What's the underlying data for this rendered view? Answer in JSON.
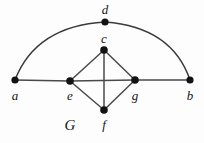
{
  "figure": {
    "name": "G",
    "name_label_position": {
      "x": 70,
      "y": 125
    },
    "background_color": "#fdfdfd",
    "edge_color": "#4a4a4a",
    "arc_color": "#3b3b3b",
    "vertex_color": "#121212",
    "label_color": "#161616",
    "width": 204,
    "height": 143
  },
  "graph_data": {
    "type": "undirected-graph",
    "vertex_count": 7,
    "edge_count": 8,
    "vertices": [
      {
        "id": "a",
        "label": "a",
        "x": 15,
        "y": 80,
        "r": 3.6,
        "label_x": 15,
        "label_y": 95
      },
      {
        "id": "b",
        "label": "b",
        "x": 190,
        "y": 80,
        "r": 3.6,
        "label_x": 190,
        "label_y": 95
      },
      {
        "id": "c",
        "label": "c",
        "x": 104,
        "y": 50,
        "r": 3.8,
        "label_x": 104,
        "label_y": 38
      },
      {
        "id": "d",
        "label": "d",
        "x": 105,
        "y": 22,
        "r": 3.6,
        "label_x": 105,
        "label_y": 9
      },
      {
        "id": "e",
        "label": "e",
        "x": 70,
        "y": 81,
        "r": 3.8,
        "label_x": 70,
        "label_y": 95
      },
      {
        "id": "f",
        "label": "f",
        "x": 104,
        "y": 110,
        "r": 3.8,
        "label_x": 104,
        "label_y": 124
      },
      {
        "id": "g",
        "label": "g",
        "x": 135,
        "y": 80,
        "r": 3.8,
        "label_x": 135,
        "label_y": 95
      }
    ],
    "straight_edges": [
      {
        "id": "a-e",
        "from": "a",
        "to": "e",
        "x1": 15,
        "y1": 80,
        "x2": 70,
        "y2": 81
      },
      {
        "id": "e-g",
        "from": "e",
        "to": "g",
        "x1": 70,
        "y1": 81,
        "x2": 135,
        "y2": 80
      },
      {
        "id": "g-b",
        "from": "g",
        "to": "b",
        "x1": 135,
        "y1": 80,
        "x2": 190,
        "y2": 80
      },
      {
        "id": "c-e",
        "from": "c",
        "to": "e",
        "x1": 104,
        "y1": 50,
        "x2": 70,
        "y2": 81
      },
      {
        "id": "c-g",
        "from": "c",
        "to": "g",
        "x1": 104,
        "y1": 50,
        "x2": 135,
        "y2": 80
      },
      {
        "id": "e-f",
        "from": "e",
        "to": "f",
        "x1": 70,
        "y1": 81,
        "x2": 104,
        "y2": 110
      },
      {
        "id": "f-g",
        "from": "f",
        "to": "g",
        "x1": 104,
        "y1": 110,
        "x2": 135,
        "y2": 80
      },
      {
        "id": "c-f",
        "from": "c",
        "to": "f",
        "x1": 104,
        "y1": 50,
        "x2": 104,
        "y2": 110
      }
    ],
    "curved_edges": [
      {
        "id": "a-d",
        "from": "a",
        "to": "d",
        "path": "M 15 80 Q 36 26 105 22"
      },
      {
        "id": "d-b",
        "from": "d",
        "to": "b",
        "path": "M 105 22 Q 172 27 190 80"
      }
    ]
  }
}
